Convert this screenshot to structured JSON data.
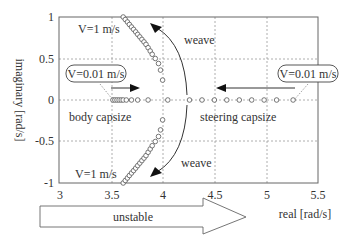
{
  "chart_data": {
    "type": "scatter",
    "title": "",
    "xlabel": "real [rad/s]",
    "ylabel": "imaginary [rad/s]",
    "xlim": [
      3,
      5.5
    ],
    "ylim": [
      -1,
      1
    ],
    "xticks": [
      "3",
      "3.5",
      "4",
      "4.5",
      "5",
      "5.5"
    ],
    "yticks": [
      "1",
      "0.5",
      "0",
      "-0.5",
      "-1"
    ],
    "grid": true,
    "series": [
      {
        "name": "weave (upper branch)",
        "x": [
          3.62,
          3.64,
          3.66,
          3.68,
          3.7,
          3.72,
          3.74,
          3.76,
          3.78,
          3.8,
          3.82,
          3.84,
          3.86,
          3.88,
          3.9,
          3.93,
          3.96,
          3.98,
          4.0
        ],
        "y": [
          1.0,
          0.97,
          0.94,
          0.91,
          0.88,
          0.85,
          0.82,
          0.79,
          0.76,
          0.73,
          0.7,
          0.67,
          0.63,
          0.59,
          0.55,
          0.5,
          0.44,
          0.36,
          0.24
        ]
      },
      {
        "name": "weave (lower branch)",
        "x": [
          3.62,
          3.64,
          3.66,
          3.68,
          3.7,
          3.72,
          3.74,
          3.76,
          3.78,
          3.8,
          3.82,
          3.84,
          3.86,
          3.88,
          3.9,
          3.93,
          3.96,
          3.98,
          4.0
        ],
        "y": [
          -1.0,
          -0.97,
          -0.94,
          -0.91,
          -0.88,
          -0.85,
          -0.82,
          -0.79,
          -0.76,
          -0.73,
          -0.7,
          -0.67,
          -0.63,
          -0.59,
          -0.55,
          -0.5,
          -0.44,
          -0.36,
          -0.24
        ]
      },
      {
        "name": "body capsize",
        "x": [
          3.52,
          3.54,
          3.56,
          3.58,
          3.6,
          3.62,
          3.65,
          3.7,
          3.76,
          3.86
        ],
        "y": [
          0,
          0,
          0,
          0,
          0,
          0,
          0,
          0,
          0,
          0
        ]
      },
      {
        "name": "steering capsize",
        "x": [
          5.26,
          5.1,
          4.98,
          4.86,
          4.74,
          4.62,
          4.5,
          4.38,
          4.26,
          4.05
        ],
        "y": [
          0,
          0,
          0,
          0,
          0,
          0,
          0,
          0,
          0,
          0
        ]
      }
    ],
    "annotations": [
      {
        "text": "V=1  m/s",
        "x": 3.33,
        "y": 0.82
      },
      {
        "text": "V=1  m/s",
        "x": 3.33,
        "y": -0.92
      },
      {
        "text": "V=0.01 m/s",
        "x": 3.28,
        "y": 0.24,
        "boxed": true
      },
      {
        "text": "V=0.01 m/s",
        "x": 5.38,
        "y": 0.24,
        "boxed": true
      },
      {
        "text": "weave",
        "x": 4.27,
        "y": 0.82
      },
      {
        "text": "weave",
        "x": 4.27,
        "y": -0.82
      },
      {
        "text": "body capsize",
        "x": 3.2,
        "y": -0.18
      },
      {
        "text": "steering capsize",
        "x": 4.6,
        "y": -0.18
      },
      {
        "text": "unstable",
        "x": 3.7,
        "y": -1.55
      }
    ]
  },
  "labels": {
    "xlabel": "real [rad/s]",
    "ylabel": "imaginary [rad/s]",
    "v1_top": "V=1  m/s",
    "v1_bottom": "V=1  m/s",
    "v001_left": "V=0.01 m/s",
    "v001_right": "V=0.01 m/s",
    "weave_top": "weave",
    "weave_bottom": "weave",
    "body_capsize": "body capsize",
    "steering_capsize": "steering capsize",
    "unstable": "unstable"
  },
  "ticks": {
    "x": [
      "3",
      "3.5",
      "4",
      "4.5",
      "5",
      "5.5"
    ],
    "y": [
      "1",
      "0.5",
      "0",
      "-0.5",
      "-1"
    ]
  }
}
